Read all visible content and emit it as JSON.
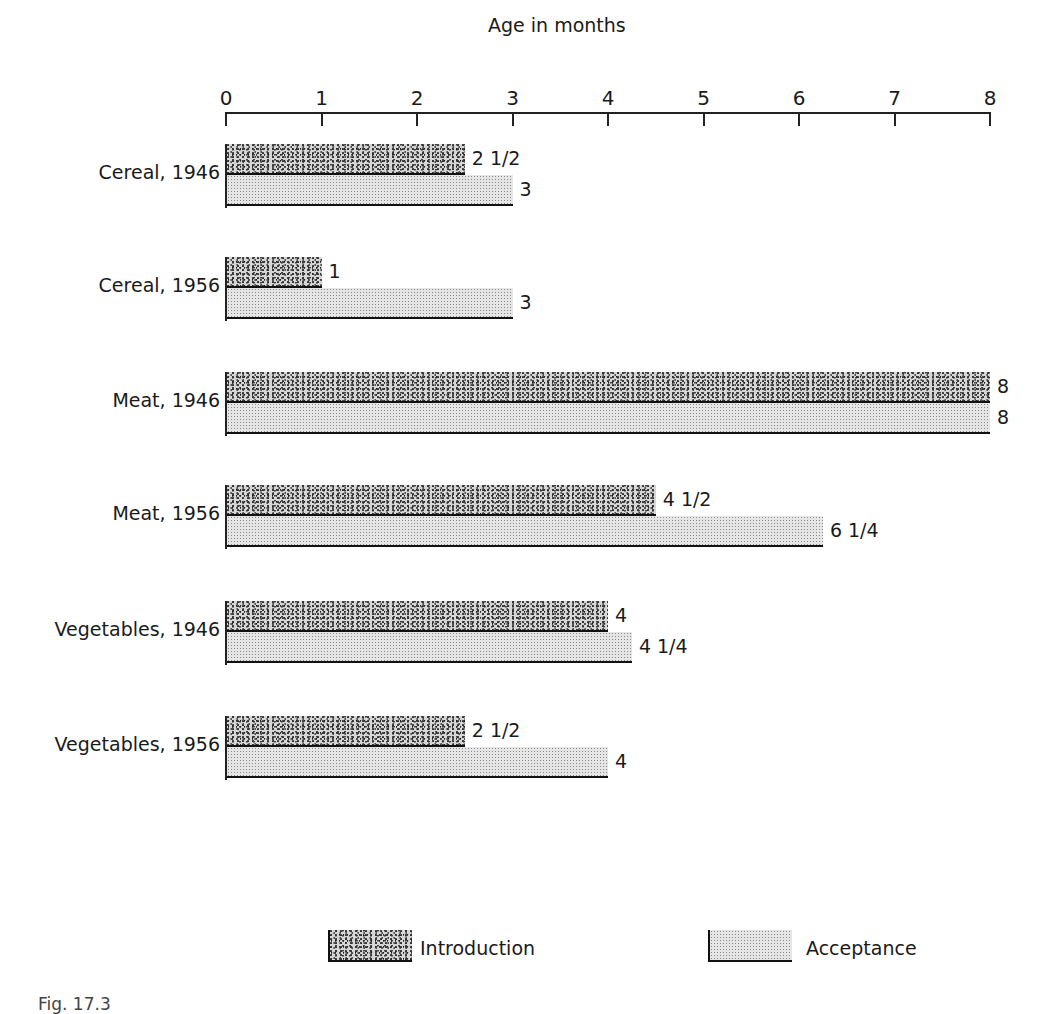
{
  "chart_data": {
    "type": "bar",
    "orientation": "horizontal",
    "title": "",
    "xlabel": "Age in months",
    "ylabel": "",
    "xlim": [
      0,
      8
    ],
    "xticks": [
      "0",
      "1",
      "2",
      "3",
      "4",
      "5",
      "6",
      "7",
      "8"
    ],
    "grid": false,
    "legend_position": "bottom",
    "categories": [
      "Cereal, 1946",
      "Cereal, 1956",
      "Meat, 1946",
      "Meat, 1956",
      "Vegetables, 1946",
      "Vegetables, 1956"
    ],
    "series": [
      {
        "name": "Introduction",
        "values": [
          2.5,
          1,
          8,
          4.5,
          4,
          2.5
        ],
        "labels": [
          "2 1/2",
          "1",
          "8",
          "4 1/2",
          "4",
          "2 1/2"
        ]
      },
      {
        "name": "Acceptance",
        "values": [
          3,
          3,
          8,
          6.25,
          4.25,
          4
        ],
        "labels": [
          "3",
          "3",
          "8",
          "6 1/4",
          "4 1/4",
          "4"
        ]
      }
    ]
  },
  "axis": {
    "title": "Age in months"
  },
  "legend": {
    "introduction": "Introduction",
    "acceptance": "Acceptance"
  },
  "caption": "Fig. 17.3"
}
